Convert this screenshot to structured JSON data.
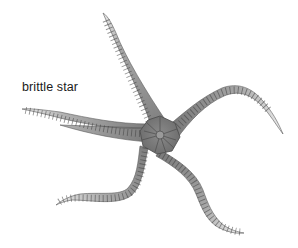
{
  "label": {
    "text": "brittle star"
  },
  "illustration": {
    "subject": "brittle-star",
    "arm_count": 5,
    "colors": {
      "arm_fill": "#8f8f8f",
      "arm_fill_light": "#c9c9c9",
      "disc_fill": "#7a7a7a",
      "segment_line": "#444444",
      "background": "#ffffff"
    }
  }
}
